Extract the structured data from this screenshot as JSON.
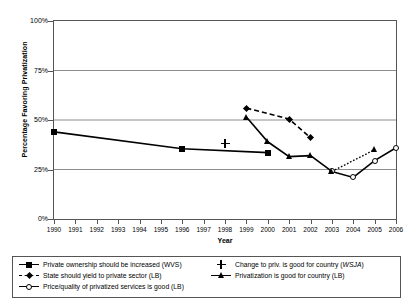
{
  "chart_data": {
    "type": "line",
    "title": "",
    "xlabel": "Year",
    "ylabel": "Percentage Favoring Privatization",
    "xlim": [
      1990,
      2006
    ],
    "ylim": [
      0,
      100
    ],
    "x_ticks": [
      1990,
      1991,
      1992,
      1993,
      1994,
      1995,
      1996,
      1997,
      1998,
      1999,
      2000,
      2001,
      2002,
      2003,
      2004,
      2005,
      2006
    ],
    "y_ticks": [
      0,
      25,
      50,
      75,
      100
    ],
    "y_tick_labels": [
      "0%",
      "25%",
      "50%",
      "75%",
      "100%"
    ],
    "grid": "horizontal",
    "legend_position": "bottom",
    "series": [
      {
        "name": "Private ownership should be increased (WVS)",
        "label_plain": "Private ownership should be increased (WVS)",
        "marker": "filled-square",
        "line": "solid",
        "x": [
          1990,
          1996,
          2000
        ],
        "values": [
          44,
          35.5,
          33.5
        ]
      },
      {
        "name": "State should yield to private sector (LB)",
        "label_plain": "State should yield to private sector (LB)",
        "marker": "filled-diamond",
        "line": "dashed",
        "x": [
          1999,
          2001,
          2002
        ],
        "values": [
          56,
          50.5,
          41
        ]
      },
      {
        "name": "Price/quality of privatized services is good (LB)",
        "label_plain": "Price/quality of privatized services is good (LB)",
        "marker": "open-circle",
        "line": "solid",
        "x": [
          2003,
          2004,
          2005,
          2006
        ],
        "values": [
          24,
          21,
          29.5,
          36
        ]
      },
      {
        "name": "Change to priv. is good for country (WSJA)",
        "label_plain": "Change to priv. is good for country (",
        "label_italic": "WSJA",
        "label_tail": ")",
        "marker": "plus",
        "line": "none",
        "x": [
          1998
        ],
        "values": [
          38
        ]
      },
      {
        "name": "Privatization is good for country (LB)",
        "label_plain": "Privatization is good for country (LB)",
        "marker": "filled-triangle",
        "line": "solid-and-dotted",
        "x": [
          1999,
          2000,
          2001,
          2002,
          2003,
          2005
        ],
        "values": [
          51.5,
          39,
          31.5,
          32,
          24,
          35
        ]
      }
    ]
  },
  "legend": {
    "entries": [
      {
        "label": "Private ownership should be increased (WVS)"
      },
      {
        "label": "State should yield to private sector (LB)"
      },
      {
        "label": "Price/quality of privatized services is good (LB)"
      },
      {
        "label_pre": "Change to priv. is good for country (",
        "label_italic": "WSJA",
        "label_post": ")"
      },
      {
        "label": "Privatization is good for country (LB)"
      }
    ]
  }
}
